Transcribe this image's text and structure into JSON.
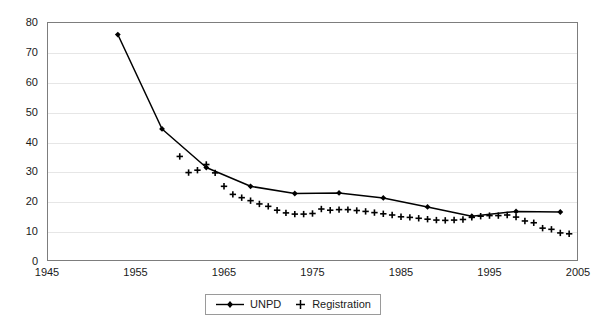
{
  "chart_data": {
    "type": "line",
    "title": "",
    "xlabel": "",
    "ylabel": "",
    "xlim": [
      1945,
      2005
    ],
    "ylim": [
      0,
      80
    ],
    "xticks": [
      1945,
      1955,
      1965,
      1975,
      1985,
      1995,
      2005
    ],
    "yticks": [
      0,
      10,
      20,
      30,
      40,
      50,
      60,
      70,
      80
    ],
    "grid": true,
    "legend_position": "bottom-center",
    "series": [
      {
        "name": "UNPD",
        "marker": "diamond",
        "line": true,
        "color": "#000000",
        "points": [
          {
            "x": 1953,
            "y": 75.8
          },
          {
            "x": 1958,
            "y": 44.2
          },
          {
            "x": 1963,
            "y": 31.3
          },
          {
            "x": 1968,
            "y": 25.0
          },
          {
            "x": 1973,
            "y": 22.6
          },
          {
            "x": 1978,
            "y": 22.8
          },
          {
            "x": 1983,
            "y": 21.1
          },
          {
            "x": 1988,
            "y": 18.1
          },
          {
            "x": 1993,
            "y": 15.0
          },
          {
            "x": 1998,
            "y": 16.6
          },
          {
            "x": 2003,
            "y": 16.4
          }
        ]
      },
      {
        "name": "Registration",
        "marker": "plus",
        "line": false,
        "color": "#000000",
        "points": [
          {
            "x": 1960,
            "y": 35.0
          },
          {
            "x": 1961,
            "y": 29.6
          },
          {
            "x": 1962,
            "y": 30.4
          },
          {
            "x": 1963,
            "y": 32.3
          },
          {
            "x": 1964,
            "y": 29.5
          },
          {
            "x": 1965,
            "y": 25.0
          },
          {
            "x": 1966,
            "y": 22.3
          },
          {
            "x": 1967,
            "y": 21.2
          },
          {
            "x": 1968,
            "y": 20.2
          },
          {
            "x": 1969,
            "y": 19.1
          },
          {
            "x": 1970,
            "y": 18.3
          },
          {
            "x": 1971,
            "y": 17.0
          },
          {
            "x": 1972,
            "y": 16.1
          },
          {
            "x": 1973,
            "y": 15.7
          },
          {
            "x": 1974,
            "y": 15.7
          },
          {
            "x": 1975,
            "y": 15.9
          },
          {
            "x": 1976,
            "y": 17.4
          },
          {
            "x": 1977,
            "y": 17.0
          },
          {
            "x": 1978,
            "y": 17.2
          },
          {
            "x": 1979,
            "y": 17.2
          },
          {
            "x": 1980,
            "y": 16.9
          },
          {
            "x": 1981,
            "y": 16.6
          },
          {
            "x": 1982,
            "y": 16.2
          },
          {
            "x": 1983,
            "y": 15.8
          },
          {
            "x": 1984,
            "y": 15.4
          },
          {
            "x": 1985,
            "y": 14.8
          },
          {
            "x": 1986,
            "y": 14.6
          },
          {
            "x": 1987,
            "y": 14.3
          },
          {
            "x": 1988,
            "y": 14.0
          },
          {
            "x": 1989,
            "y": 13.7
          },
          {
            "x": 1990,
            "y": 13.6
          },
          {
            "x": 1991,
            "y": 13.7
          },
          {
            "x": 1992,
            "y": 13.9
          },
          {
            "x": 1993,
            "y": 14.6
          },
          {
            "x": 1994,
            "y": 15.0
          },
          {
            "x": 1995,
            "y": 15.2
          },
          {
            "x": 1996,
            "y": 15.2
          },
          {
            "x": 1997,
            "y": 15.4
          },
          {
            "x": 1998,
            "y": 14.7
          },
          {
            "x": 1999,
            "y": 13.4
          },
          {
            "x": 2000,
            "y": 12.8
          },
          {
            "x": 2001,
            "y": 11.0
          },
          {
            "x": 2002,
            "y": 10.6
          },
          {
            "x": 2003,
            "y": 9.4
          },
          {
            "x": 2004,
            "y": 9.1
          }
        ]
      }
    ]
  },
  "legend": {
    "entries": [
      {
        "label": "UNPD"
      },
      {
        "label": "Registration"
      }
    ]
  }
}
